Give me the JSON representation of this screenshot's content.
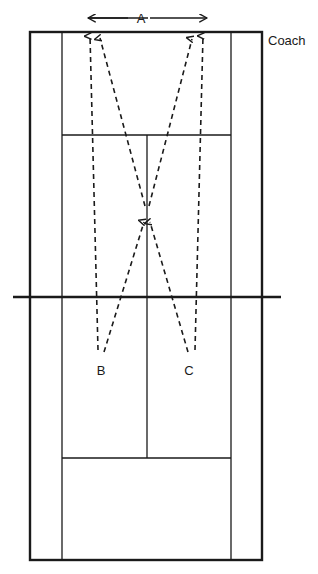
{
  "diagram": {
    "title_visible": false,
    "type": "badminton-court-drill-diagram",
    "colors": {
      "line": "#1a1a1a",
      "dashed_path": "#1a1a1a",
      "background": "#ffffff",
      "text": "#1a1a1a"
    },
    "labels": {
      "dimension_a": "A",
      "target_b": "B",
      "target_c": "C",
      "coach": "Coach"
    },
    "court": {
      "outer_boundary": {
        "x1": 30,
        "y1": 32,
        "x2": 262,
        "y2": 560
      },
      "left_sideline_x": 62,
      "right_sideline_x": 231,
      "top_service_line_y": 135,
      "bottom_service_line_y": 458,
      "centre_line_x": 147,
      "net_line_y": 297,
      "net_line_x1": 13,
      "net_line_x2": 281
    },
    "markers": {
      "base_position": {
        "x": 147,
        "y": 211
      },
      "rear_left_corner": {
        "x": 99,
        "y": 33
      },
      "rear_right_corner": {
        "x": 193,
        "y": 34
      },
      "front_left_target": {
        "x": 99,
        "y": 356
      },
      "front_right_target": {
        "x": 193,
        "y": 356
      }
    },
    "dimension_arrow": {
      "label": "A",
      "y": 18,
      "x_start": 88,
      "x_end": 207
    },
    "movement_paths": [
      {
        "name": "base-to-rear-left",
        "from": "base_position",
        "to": "rear_left_corner",
        "style": "dashed",
        "arrow": "end"
      },
      {
        "name": "rear-left-to-front-left",
        "from": "rear_left_corner",
        "to": "front_left_target",
        "style": "dashed",
        "arrow": "end"
      },
      {
        "name": "base-to-rear-right",
        "from": "base_position",
        "to": "rear_right_corner",
        "style": "dashed",
        "arrow": "end"
      },
      {
        "name": "rear-right-to-front-right",
        "from": "rear_right_corner",
        "to": "front_right_target",
        "style": "dashed",
        "arrow": "end"
      },
      {
        "name": "front-left-to-base",
        "from": "front_left_target",
        "to": "base_position",
        "style": "dashed",
        "arrow": "end"
      },
      {
        "name": "front-right-to-base",
        "from": "front_right_target",
        "to": "base_position",
        "style": "dashed",
        "arrow": "end"
      }
    ]
  }
}
